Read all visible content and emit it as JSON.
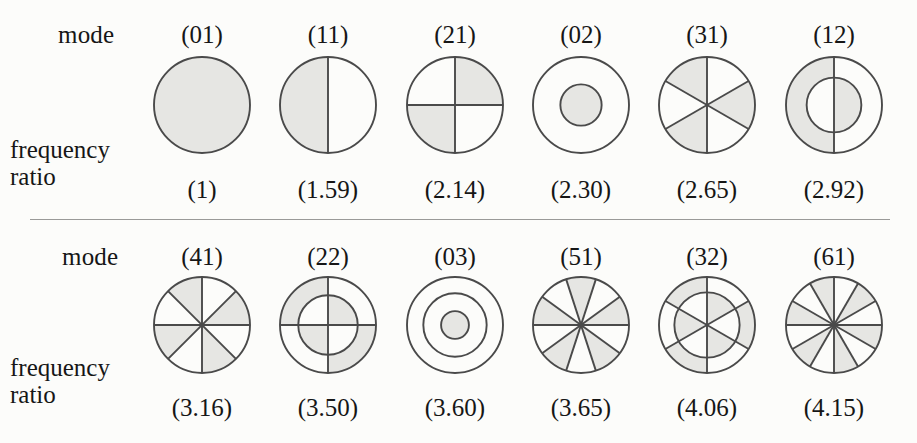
{
  "figure": {
    "row_labels": {
      "mode": "mode",
      "frequency": "frequency",
      "ratio": "ratio"
    },
    "style": {
      "shade_color": "#e6e6e3",
      "line_color": "#4a4a4a",
      "background": "#fcfcfa",
      "divider_color": "#9a9a98"
    }
  },
  "chart_data": {
    "type": "diagram",
    "xlabel": "mode",
    "ylabel": "frequency ratio",
    "categories": [
      "(01)",
      "(11)",
      "(21)",
      "(02)",
      "(31)",
      "(12)",
      "(41)",
      "(22)",
      "(03)",
      "(51)",
      "(32)",
      "(61)"
    ],
    "values": [
      1,
      1.59,
      2.14,
      2.3,
      2.65,
      2.92,
      3.16,
      3.5,
      3.6,
      3.65,
      4.06,
      4.15
    ],
    "rows": [
      {
        "modes": [
          {
            "mode": "(01)",
            "ratio": "(1)",
            "nodal_diameters": 0,
            "nodal_circles": 1,
            "rings": [
              1.0
            ],
            "sectors": 0,
            "start_angle": 0,
            "shaded_first": true
          },
          {
            "mode": "(11)",
            "ratio": "(1.59)",
            "nodal_diameters": 1,
            "nodal_circles": 1,
            "rings": [
              1.0
            ],
            "sectors": 2,
            "start_angle": 90,
            "shaded_first": true
          },
          {
            "mode": "(21)",
            "ratio": "(2.14)",
            "nodal_diameters": 2,
            "nodal_circles": 1,
            "rings": [
              1.0
            ],
            "sectors": 4,
            "start_angle": 0,
            "shaded_first": true
          },
          {
            "mode": "(02)",
            "ratio": "(2.30)",
            "nodal_diameters": 0,
            "nodal_circles": 2,
            "rings": [
              1.0,
              0.43
            ],
            "sectors": 0,
            "start_angle": 0,
            "shaded_first": false
          },
          {
            "mode": "(31)",
            "ratio": "(2.65)",
            "nodal_diameters": 3,
            "nodal_circles": 1,
            "rings": [
              1.0
            ],
            "sectors": 6,
            "start_angle": 90,
            "shaded_first": true
          },
          {
            "mode": "(12)",
            "ratio": "(2.92)",
            "nodal_diameters": 1,
            "nodal_circles": 2,
            "rings": [
              1.0,
              0.57
            ],
            "sectors": 2,
            "start_angle": 90,
            "shaded_first": true
          }
        ]
      },
      {
        "modes": [
          {
            "mode": "(41)",
            "ratio": "(3.16)",
            "nodal_diameters": 4,
            "nodal_circles": 1,
            "rings": [
              1.0
            ],
            "sectors": 8,
            "start_angle": 90,
            "shaded_first": true
          },
          {
            "mode": "(22)",
            "ratio": "(3.50)",
            "nodal_diameters": 2,
            "nodal_circles": 2,
            "rings": [
              1.0,
              0.62
            ],
            "sectors": 4,
            "start_angle": 0,
            "shaded_first": false
          },
          {
            "mode": "(03)",
            "ratio": "(3.60)",
            "nodal_diameters": 0,
            "nodal_circles": 3,
            "rings": [
              1.0,
              0.66,
              0.29
            ],
            "sectors": 0,
            "start_angle": 0,
            "shaded_first": true
          },
          {
            "mode": "(51)",
            "ratio": "(3.65)",
            "nodal_diameters": 5,
            "nodal_circles": 1,
            "rings": [
              1.0
            ],
            "sectors": 10,
            "start_angle": 0,
            "shaded_first": true
          },
          {
            "mode": "(32)",
            "ratio": "(4.06)",
            "nodal_diameters": 3,
            "nodal_circles": 2,
            "rings": [
              1.0,
              0.68
            ],
            "sectors": 6,
            "start_angle": 90,
            "shaded_first": true
          },
          {
            "mode": "(61)",
            "ratio": "(4.15)",
            "nodal_diameters": 6,
            "nodal_circles": 1,
            "rings": [
              1.0
            ],
            "sectors": 12,
            "start_angle": 90,
            "shaded_first": true
          }
        ]
      }
    ]
  }
}
